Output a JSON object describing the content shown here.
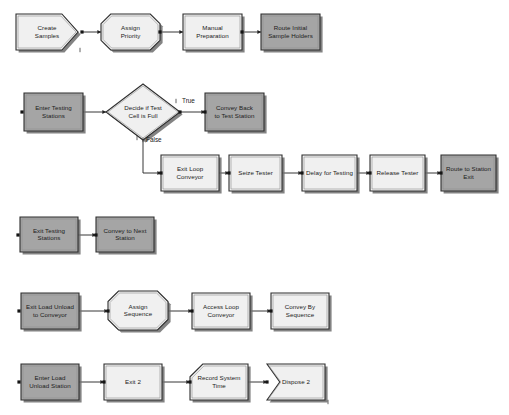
{
  "diagram": {
    "colors": {
      "light_fill": "#f0f0f0",
      "gray_fill": "#a5a5a5",
      "outline": "#2e2e2e",
      "shadow": "#6d6d6d",
      "connector": "#202020",
      "text": "#1b1b1b"
    },
    "rows": [
      {
        "id": "row-create",
        "nodes": [
          {
            "id": "create-samples",
            "label": "Create\nSamples",
            "shape": "create",
            "fill": "light",
            "x": 16,
            "y": 14,
            "w": 62,
            "h": 36
          },
          {
            "id": "assign-priority",
            "label": "Assign\nPriority",
            "shape": "octagon",
            "fill": "light",
            "x": 101,
            "y": 14,
            "w": 59,
            "h": 36
          },
          {
            "id": "manual-preparation",
            "label": "Manual\nPreparation",
            "shape": "rect",
            "fill": "light",
            "x": 183,
            "y": 14,
            "w": 59,
            "h": 36
          },
          {
            "id": "route-initial-holders",
            "label": "Route Initial\nSample Holders",
            "shape": "rect",
            "fill": "gray",
            "x": 261,
            "y": 14,
            "w": 59,
            "h": 36
          }
        ]
      },
      {
        "id": "row-decide",
        "nodes": [
          {
            "id": "enter-testing-stations",
            "label": "Enter Testing\nStations",
            "shape": "rect",
            "fill": "gray",
            "x": 24,
            "y": 93,
            "w": 59,
            "h": 38
          },
          {
            "id": "decide-test-cell-full",
            "label": "Decide if Test\nCell is Full",
            "shape": "diamond",
            "fill": "light",
            "x": 106,
            "y": 84,
            "w": 74,
            "h": 56
          },
          {
            "id": "convey-back-test",
            "label": "Convey Back\nto Test Station",
            "shape": "rect",
            "fill": "gray",
            "x": 205,
            "y": 93,
            "w": 59,
            "h": 38
          }
        ],
        "branch_labels": [
          {
            "id": "branch-true",
            "label": "True",
            "x": 182,
            "y": 101
          },
          {
            "id": "branch-false",
            "label": "False",
            "x": 146,
            "y": 140
          }
        ]
      },
      {
        "id": "row-process",
        "nodes": [
          {
            "id": "exit-loop-conveyor",
            "label": "Exit Loop\nConveyor",
            "shape": "rect",
            "fill": "light",
            "x": 161,
            "y": 155,
            "w": 58,
            "h": 36
          },
          {
            "id": "seize-tester",
            "label": "Seize Tester",
            "shape": "rect",
            "fill": "light",
            "x": 229,
            "y": 155,
            "w": 53,
            "h": 36
          },
          {
            "id": "delay-for-testing",
            "label": "Delay for Testing",
            "shape": "rect",
            "fill": "light",
            "x": 302,
            "y": 155,
            "w": 55,
            "h": 36
          },
          {
            "id": "release-tester",
            "label": "Release Tester",
            "shape": "rect",
            "fill": "light",
            "x": 370,
            "y": 155,
            "w": 55,
            "h": 36
          },
          {
            "id": "route-station-exit",
            "label": "Route to Station\nExit",
            "shape": "rect",
            "fill": "gray",
            "x": 441,
            "y": 155,
            "w": 55,
            "h": 36
          }
        ]
      },
      {
        "id": "row-exit-testing",
        "nodes": [
          {
            "id": "exit-testing-stations",
            "label": "Exit Testing\nStations",
            "shape": "rect",
            "fill": "gray",
            "x": 20,
            "y": 217,
            "w": 58,
            "h": 35
          },
          {
            "id": "convey-next-station",
            "label": "Convey to Next\nStation",
            "shape": "rect",
            "fill": "gray",
            "x": 96,
            "y": 217,
            "w": 58,
            "h": 35
          }
        ]
      },
      {
        "id": "row-sequence",
        "nodes": [
          {
            "id": "exit-load-unload-conveyor",
            "label": "Exit Load Unload\nto Conveyor",
            "shape": "rect",
            "fill": "gray",
            "x": 21,
            "y": 293,
            "w": 58,
            "h": 36
          },
          {
            "id": "assign-sequence",
            "label": "Assign\nSequence",
            "shape": "octagon",
            "fill": "light",
            "x": 108,
            "y": 291,
            "w": 60,
            "h": 39
          },
          {
            "id": "access-loop-conveyor",
            "label": "Access Loop\nConveyor",
            "shape": "rect",
            "fill": "light",
            "x": 192,
            "y": 293,
            "w": 58,
            "h": 36
          },
          {
            "id": "convey-by-sequence",
            "label": "Convey By\nSequence",
            "shape": "rect",
            "fill": "light",
            "x": 271,
            "y": 293,
            "w": 58,
            "h": 36
          }
        ]
      },
      {
        "id": "row-dispose",
        "nodes": [
          {
            "id": "enter-load-unload-station",
            "label": "Enter Load\nUnload Station",
            "shape": "rect",
            "fill": "gray",
            "x": 21,
            "y": 364,
            "w": 58,
            "h": 36
          },
          {
            "id": "exit-2",
            "label": "Exit 2",
            "shape": "rect",
            "fill": "light",
            "x": 104,
            "y": 364,
            "w": 58,
            "h": 36
          },
          {
            "id": "record-system-time",
            "label": "Record System\nTime",
            "shape": "record",
            "fill": "light",
            "x": 190,
            "y": 364,
            "w": 58,
            "h": 36
          },
          {
            "id": "dispose-2",
            "label": "Dispose 2",
            "shape": "dispose",
            "fill": "light",
            "x": 267,
            "y": 364,
            "w": 58,
            "h": 36
          }
        ]
      }
    ],
    "connectors": [
      {
        "id": "conn-create-to-assign",
        "from": "create-samples",
        "to": "assign-priority",
        "path": "M 82,32 L 101,32"
      },
      {
        "id": "conn-assign-to-manual",
        "from": "assign-priority",
        "to": "manual-preparation",
        "path": "M 160,32 L 183,32"
      },
      {
        "id": "conn-manual-to-route",
        "from": "manual-preparation",
        "to": "route-initial-holders",
        "path": "M 242,32 L 261,32"
      },
      {
        "id": "conn-enter-to-decide",
        "from": "enter-testing-stations",
        "to": "decide-test-cell-full",
        "path": "M 83,112 L 106,112"
      },
      {
        "id": "conn-decide-true",
        "from": "decide-test-cell-full",
        "to": "convey-back-test",
        "path": "M 180,112 L 205,112"
      },
      {
        "id": "conn-decide-false",
        "from": "decide-test-cell-full",
        "to": "exit-loop-conveyor",
        "path": "M 143,140 L 143,173 L 161,173"
      },
      {
        "id": "conn-exitloop-to-seize",
        "from": "exit-loop-conveyor",
        "to": "seize-tester",
        "path": "M 219,173 L 229,173"
      },
      {
        "id": "conn-seize-to-delay",
        "from": "seize-tester",
        "to": "delay-for-testing",
        "path": "M 282,173 L 302,173"
      },
      {
        "id": "conn-delay-to-release",
        "from": "delay-for-testing",
        "to": "release-tester",
        "path": "M 357,173 L 370,173"
      },
      {
        "id": "conn-release-to-route",
        "from": "release-tester",
        "to": "route-station-exit",
        "path": "M 425,173 L 441,173"
      },
      {
        "id": "conn-exittest-to-convey",
        "from": "exit-testing-stations",
        "to": "convey-next-station",
        "path": "M 78,235 L 96,235"
      },
      {
        "id": "conn-exitload-to-assign",
        "from": "exit-load-unload-conveyor",
        "to": "assign-sequence",
        "path": "M 79,311 L 108,311"
      },
      {
        "id": "conn-assignseq-to-access",
        "from": "assign-sequence",
        "to": "access-loop-conveyor",
        "path": "M 168,311 L 192,311"
      },
      {
        "id": "conn-access-to-conveyby",
        "from": "access-loop-conveyor",
        "to": "convey-by-sequence",
        "path": "M 250,311 L 271,311"
      },
      {
        "id": "conn-enterload-to-exit2",
        "from": "enter-load-unload-station",
        "to": "exit-2",
        "path": "M 79,382 L 104,382"
      },
      {
        "id": "conn-exit2-to-record",
        "from": "exit-2",
        "to": "record-system-time",
        "path": "M 162,382 L 190,382"
      },
      {
        "id": "conn-record-to-dispose",
        "from": "record-system-time",
        "to": "dispose-2",
        "path": "M 248,382 L 267,382"
      }
    ],
    "connection_dots": [
      {
        "id": "dot-enter-testing-in",
        "x": 22,
        "y": 112
      },
      {
        "id": "dot-exit-testing-in",
        "x": 18,
        "y": 235
      },
      {
        "id": "dot-exit-load-in",
        "x": 19,
        "y": 311
      },
      {
        "id": "dot-enter-load-in",
        "x": 19,
        "y": 382
      },
      {
        "id": "dot-create-out",
        "x": 82,
        "y": 32
      },
      {
        "id": "dot-assign-out",
        "x": 160,
        "y": 32
      },
      {
        "id": "dot-manual-out",
        "x": 242,
        "y": 32
      },
      {
        "id": "dot-decide-true-out",
        "x": 180,
        "y": 112
      },
      {
        "id": "dot-convey-back-in",
        "x": 205,
        "y": 112
      },
      {
        "id": "dot-exitloop-in",
        "x": 161,
        "y": 173
      },
      {
        "id": "dot-seize-in",
        "x": 229,
        "y": 173
      },
      {
        "id": "dot-delay-in",
        "x": 302,
        "y": 173
      },
      {
        "id": "dot-release-in",
        "x": 370,
        "y": 173
      },
      {
        "id": "dot-routeexit-in",
        "x": 441,
        "y": 173
      },
      {
        "id": "dot-convey-next-in",
        "x": 96,
        "y": 235
      },
      {
        "id": "dot-assignseq-in",
        "x": 108,
        "y": 311
      },
      {
        "id": "dot-access-in",
        "x": 192,
        "y": 311
      },
      {
        "id": "dot-conveyby-in",
        "x": 271,
        "y": 311
      },
      {
        "id": "dot-exit2-in",
        "x": 104,
        "y": 382
      },
      {
        "id": "dot-record-in",
        "x": 190,
        "y": 382
      },
      {
        "id": "dot-dispose-in",
        "x": 267,
        "y": 382
      }
    ],
    "tick_marks": [
      {
        "id": "tick-create-bottom",
        "x": 80,
        "y": 50
      },
      {
        "id": "tick-true",
        "x": 176,
        "y": 101
      },
      {
        "id": "tick-false-a",
        "x": 137,
        "y": 138
      },
      {
        "id": "tick-false-b",
        "x": 143,
        "y": 140
      },
      {
        "id": "tick-dispose-end",
        "x": 328,
        "y": 402
      }
    ]
  }
}
